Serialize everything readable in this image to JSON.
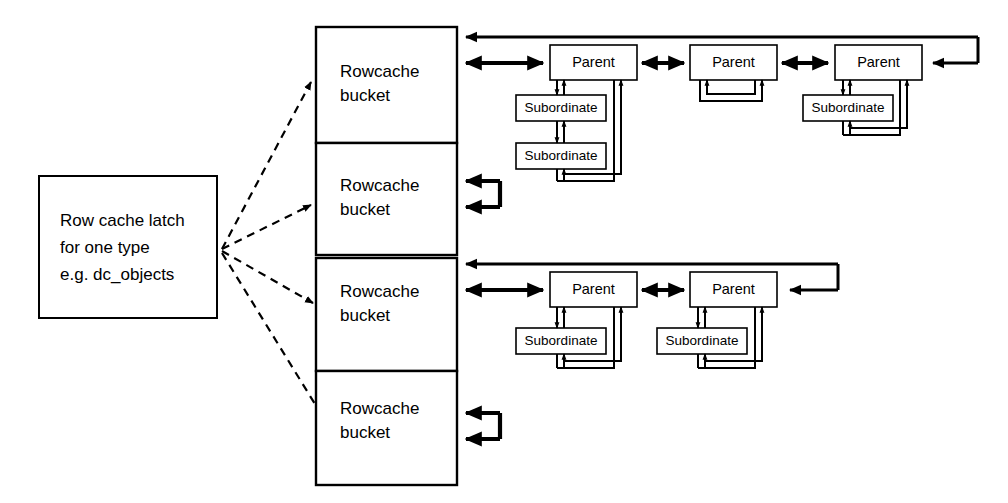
{
  "diagram": {
    "background_color": "#ffffff",
    "line_color": "#000000",
    "latch": {
      "name": "row-cache-latch",
      "lines": [
        "Row cache latch",
        "for one type",
        "e.g. dc_objects"
      ]
    },
    "buckets": [
      {
        "id": "bucket-1",
        "line1": "Rowcache",
        "line2": "bucket",
        "has_chain": true,
        "self_loop": false
      },
      {
        "id": "bucket-2",
        "line1": "Rowcache",
        "line2": "bucket",
        "has_chain": false,
        "self_loop": true
      },
      {
        "id": "bucket-3",
        "line1": "Rowcache",
        "line2": "bucket",
        "has_chain": true,
        "self_loop": false
      },
      {
        "id": "bucket-4",
        "line1": "Rowcache",
        "line2": "bucket",
        "has_chain": false,
        "self_loop": true
      }
    ],
    "chains": [
      {
        "id": "chain-top",
        "attached_bucket": "bucket-1",
        "parents": [
          {
            "label": "Parent",
            "subordinates": [
              "Subordinate",
              "Subordinate"
            ]
          },
          {
            "label": "Parent",
            "subordinates": []
          },
          {
            "label": "Parent",
            "subordinates": [
              "Subordinate"
            ]
          }
        ]
      },
      {
        "id": "chain-bottom",
        "attached_bucket": "bucket-3",
        "parents": [
          {
            "label": "Parent",
            "subordinates": [
              "Subordinate"
            ]
          },
          {
            "label": "Parent",
            "subordinates": [
              "Subordinate"
            ]
          }
        ]
      }
    ],
    "dashed_links": {
      "name": "latch-to-bucket-links",
      "count": 4,
      "style": "dashed-arrow"
    }
  }
}
